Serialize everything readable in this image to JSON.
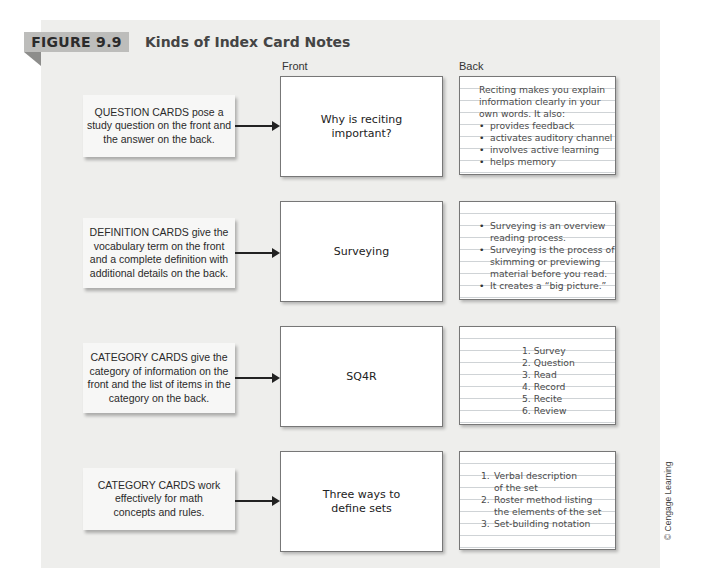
{
  "figure": {
    "label": "FIGURE 9.9",
    "title": "Kinds of Index Card Notes"
  },
  "columns": {
    "front": "Front",
    "back": "Back"
  },
  "rows": [
    {
      "description": "QUESTION CARDS pose a study question on the front and the answer on the back.",
      "front": "Why is reciting important?",
      "back_intro": [
        "Reciting makes you explain",
        "information clearly in your",
        "own words. It also:"
      ],
      "back_bullets": [
        "provides feedback",
        "activates auditory channel",
        "involves active learning",
        "helps memory"
      ]
    },
    {
      "description": "DEFINITION CARDS give the vocabulary term on the front and a complete definition with additional details on the back.",
      "front": "Surveying",
      "back_bullets": [
        [
          "Surveying is an overview",
          "reading process."
        ],
        [
          "Surveying is the process of",
          "skimming or previewing",
          "material before you read."
        ],
        [
          "It creates a “big picture.”"
        ]
      ]
    },
    {
      "description": "CATEGORY CARDS give the category of information on the front and the list of items in the category on the back.",
      "front": "SQ4R",
      "back_list": [
        "1.  Survey",
        "2. Question",
        "3. Read",
        "4. Record",
        "5. Recite",
        "6. Review"
      ]
    },
    {
      "description": "CATEGORY CARDS work effectively for math concepts and rules.",
      "front": "Three ways to define sets",
      "back_list": [
        [
          "1.",
          "Verbal description",
          "of the set"
        ],
        [
          "2.",
          "Roster method listing",
          "the elements of the set"
        ],
        [
          "3.",
          "Set-building notation"
        ]
      ]
    }
  ],
  "credit": "© Cengage Learning",
  "colors": {
    "panel_bg": "#eeeeec",
    "tab_bg": "#bdbdbb",
    "tab_fold": "#8d8d8b",
    "rule_line": "#cfd3d6"
  }
}
